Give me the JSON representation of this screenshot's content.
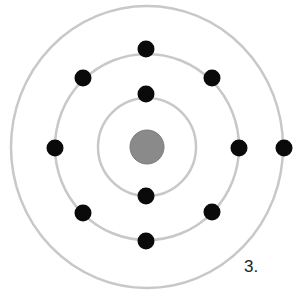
{
  "diagram": {
    "type": "atom-bohr-model",
    "label": "3.",
    "colors": {
      "orbit": "#c8c8c8",
      "electron": "#0a0a0a",
      "nucleus": "#8a8a8a",
      "nucleus_stroke": "#7a7a7a"
    },
    "nucleus": {
      "cx": 147,
      "cy": 147,
      "r": 17
    },
    "orbits": [
      {
        "name": "inner-shell",
        "rx": 49,
        "ry": 49,
        "electrons": 2
      },
      {
        "name": "middle-shell",
        "rx": 92,
        "ry": 93,
        "electrons": 8
      },
      {
        "name": "outer-shell",
        "rx": 136,
        "ry": 141,
        "electrons": 1
      }
    ],
    "electrons": [
      {
        "shell": 1,
        "x": 146,
        "y": 94
      },
      {
        "shell": 1,
        "x": 146,
        "y": 196
      },
      {
        "shell": 2,
        "x": 146,
        "y": 49
      },
      {
        "shell": 2,
        "x": 83,
        "y": 78
      },
      {
        "shell": 2,
        "x": 212,
        "y": 78
      },
      {
        "shell": 2,
        "x": 55,
        "y": 148
      },
      {
        "shell": 2,
        "x": 239,
        "y": 148
      },
      {
        "shell": 2,
        "x": 83,
        "y": 213
      },
      {
        "shell": 2,
        "x": 212,
        "y": 212
      },
      {
        "shell": 2,
        "x": 146,
        "y": 241
      },
      {
        "shell": 3,
        "x": 284,
        "y": 148
      }
    ],
    "electron_radius": 8.5
  }
}
